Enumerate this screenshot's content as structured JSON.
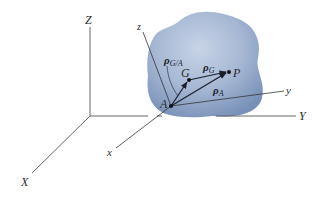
{
  "figure": {
    "type": "rigid-body-position-vectors",
    "colors": {
      "body_fill_light": "#c3d0e4",
      "body_fill_dark": "#7f97bd",
      "axis_line": "#555555",
      "vector_line": "#1a1f2b",
      "background": "#ffffff"
    },
    "fixed_axes": {
      "X": "X",
      "Y": "Y",
      "Z": "Z"
    },
    "body_axes": {
      "x": "x",
      "y": "y",
      "z": "z"
    },
    "points": {
      "A": "A",
      "G": "G",
      "P": "P"
    },
    "vectors": {
      "rho_GA": {
        "symbol": "ρ",
        "subscript": "G/A"
      },
      "rho_G": {
        "symbol": "ρ",
        "subscript": "G"
      },
      "rho_A": {
        "symbol": "ρ",
        "subscript": "A"
      }
    }
  }
}
